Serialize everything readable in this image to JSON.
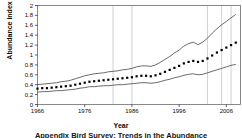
{
  "chart_data": {
    "type": "line",
    "title": "",
    "xlabel": "Year",
    "ylabel": "Abundance index",
    "xlim": [
      1966,
      2009
    ],
    "ylim": [
      0,
      2
    ],
    "grid": true,
    "legend": "none",
    "y_ticks": [
      "0",
      "0.2",
      "0.4",
      "0.6",
      "0.8",
      "1",
      "1.2",
      "1.4",
      "1.6",
      "1.8",
      "2"
    ],
    "y_tick_values": [
      0,
      0.2,
      0.4,
      0.6,
      0.8,
      1.0,
      1.2,
      1.4,
      1.6,
      1.8,
      2.0
    ],
    "x_ticks": [
      "1966",
      "1976",
      "1986",
      "1996",
      "2006"
    ],
    "x_tick_values": [
      1966,
      1976,
      1986,
      1996,
      2006
    ],
    "gridlines_x": [
      1982,
      1986,
      2002,
      2005,
      2007
    ],
    "x": [
      1966,
      1967,
      1968,
      1969,
      1970,
      1971,
      1972,
      1973,
      1974,
      1975,
      1976,
      1977,
      1978,
      1979,
      1980,
      1981,
      1982,
      1983,
      1984,
      1985,
      1986,
      1987,
      1988,
      1989,
      1990,
      1991,
      1992,
      1993,
      1994,
      1995,
      1996,
      1997,
      1998,
      1999,
      2000,
      2001,
      2002,
      2003,
      2004,
      2005,
      2006,
      2007,
      2008
    ],
    "series": [
      {
        "name": "Abundance index (estimate)",
        "style": "dotted-markers",
        "values": [
          0.32,
          0.33,
          0.33,
          0.34,
          0.35,
          0.36,
          0.37,
          0.38,
          0.4,
          0.42,
          0.44,
          0.46,
          0.47,
          0.48,
          0.49,
          0.5,
          0.51,
          0.52,
          0.53,
          0.54,
          0.55,
          0.57,
          0.58,
          0.58,
          0.57,
          0.59,
          0.62,
          0.66,
          0.7,
          0.74,
          0.78,
          0.83,
          0.86,
          0.88,
          0.86,
          0.88,
          0.93,
          0.99,
          1.05,
          1.1,
          1.15,
          1.2,
          1.25
        ]
      },
      {
        "name": "Upper confidence limit",
        "style": "solid-thin",
        "values": [
          0.4,
          0.41,
          0.42,
          0.43,
          0.44,
          0.46,
          0.47,
          0.49,
          0.52,
          0.55,
          0.58,
          0.6,
          0.62,
          0.63,
          0.64,
          0.66,
          0.67,
          0.68,
          0.7,
          0.71,
          0.73,
          0.76,
          0.78,
          0.78,
          0.77,
          0.8,
          0.85,
          0.91,
          0.97,
          1.04,
          1.1,
          1.18,
          1.23,
          1.26,
          1.21,
          1.26,
          1.34,
          1.44,
          1.53,
          1.61,
          1.68,
          1.75,
          1.82
        ]
      },
      {
        "name": "Lower confidence limit",
        "style": "solid-thin",
        "values": [
          0.25,
          0.26,
          0.26,
          0.27,
          0.28,
          0.28,
          0.29,
          0.3,
          0.31,
          0.33,
          0.34,
          0.36,
          0.36,
          0.37,
          0.38,
          0.38,
          0.39,
          0.4,
          0.4,
          0.41,
          0.42,
          0.43,
          0.44,
          0.44,
          0.43,
          0.44,
          0.46,
          0.49,
          0.51,
          0.54,
          0.56,
          0.59,
          0.61,
          0.62,
          0.6,
          0.61,
          0.64,
          0.67,
          0.7,
          0.73,
          0.76,
          0.79,
          0.81
        ]
      }
    ]
  },
  "labels": {
    "ylabel": "Abundance index",
    "xlabel": "Year",
    "caption": "Appendix Bird Survey: Trends in the Abundance"
  }
}
